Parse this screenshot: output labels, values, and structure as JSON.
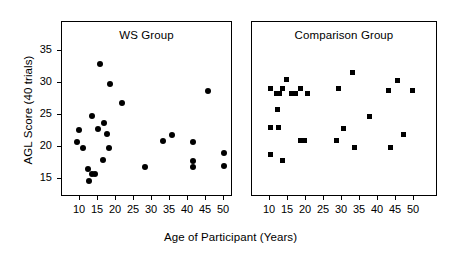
{
  "chart_data": {
    "type": "scatter",
    "title": "",
    "xlabel": "Age of Participant (Years)",
    "ylabel": "AGL Score (40 trials)",
    "xlim": [
      6,
      53
    ],
    "ylim": [
      12.5,
      37
    ],
    "xticks": [
      10,
      15,
      20,
      25,
      30,
      35,
      40,
      45,
      50
    ],
    "yticks": [
      15,
      20,
      25,
      30,
      35
    ],
    "grid": false,
    "legend": "none",
    "panels": [
      {
        "name": "ws",
        "label": "WS Group",
        "marker": "circle",
        "points": [
          {
            "x": 15.5,
            "y": 32.9
          },
          {
            "x": 18.2,
            "y": 29.8
          },
          {
            "x": 21.8,
            "y": 26.9
          },
          {
            "x": 45.5,
            "y": 28.8
          },
          {
            "x": 13.3,
            "y": 24.8
          },
          {
            "x": 16.8,
            "y": 23.8
          },
          {
            "x": 9.8,
            "y": 22.6
          },
          {
            "x": 15.0,
            "y": 22.8
          },
          {
            "x": 17.5,
            "y": 22.1
          },
          {
            "x": 35.5,
            "y": 21.9
          },
          {
            "x": 9.2,
            "y": 20.8
          },
          {
            "x": 33.0,
            "y": 20.9
          },
          {
            "x": 41.5,
            "y": 20.8
          },
          {
            "x": 10.7,
            "y": 19.8
          },
          {
            "x": 18.0,
            "y": 19.8
          },
          {
            "x": 50.0,
            "y": 19.0
          },
          {
            "x": 16.5,
            "y": 17.9
          },
          {
            "x": 28.0,
            "y": 16.9
          },
          {
            "x": 41.5,
            "y": 17.8
          },
          {
            "x": 41.5,
            "y": 16.9
          },
          {
            "x": 50.0,
            "y": 17.1
          },
          {
            "x": 12.2,
            "y": 16.6
          },
          {
            "x": 13.2,
            "y": 15.8
          },
          {
            "x": 14.3,
            "y": 15.8
          },
          {
            "x": 12.6,
            "y": 14.7
          }
        ]
      },
      {
        "name": "comparison",
        "label": "Comparison Group",
        "marker": "square",
        "points": [
          {
            "x": 33.0,
            "y": 31.7
          },
          {
            "x": 14.5,
            "y": 30.5
          },
          {
            "x": 45.5,
            "y": 30.4
          },
          {
            "x": 10.0,
            "y": 29.1
          },
          {
            "x": 13.5,
            "y": 29.2
          },
          {
            "x": 18.5,
            "y": 29.1
          },
          {
            "x": 29.0,
            "y": 29.1
          },
          {
            "x": 43.0,
            "y": 28.9
          },
          {
            "x": 49.5,
            "y": 28.9
          },
          {
            "x": 11.8,
            "y": 28.3
          },
          {
            "x": 12.6,
            "y": 28.3
          },
          {
            "x": 16.0,
            "y": 28.3
          },
          {
            "x": 17.0,
            "y": 28.3
          },
          {
            "x": 20.5,
            "y": 28.3
          },
          {
            "x": 12.0,
            "y": 25.8
          },
          {
            "x": 37.5,
            "y": 24.8
          },
          {
            "x": 10.2,
            "y": 23.0
          },
          {
            "x": 12.3,
            "y": 23.0
          },
          {
            "x": 30.5,
            "y": 22.9
          },
          {
            "x": 47.0,
            "y": 22.0
          },
          {
            "x": 18.5,
            "y": 21.0
          },
          {
            "x": 19.5,
            "y": 21.0
          },
          {
            "x": 28.5,
            "y": 21.0
          },
          {
            "x": 33.5,
            "y": 19.9
          },
          {
            "x": 43.5,
            "y": 19.9
          },
          {
            "x": 10.2,
            "y": 18.9
          },
          {
            "x": 13.5,
            "y": 17.9
          }
        ]
      }
    ]
  }
}
